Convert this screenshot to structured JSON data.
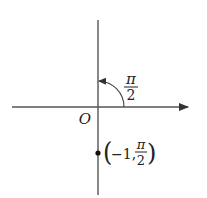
{
  "diagram": {
    "type": "polar-coordinate-plot",
    "colors": {
      "axis": "#555555",
      "text": "#222222",
      "point": "#111111",
      "background": "#ffffff"
    },
    "origin_label": "O",
    "angle_label": {
      "numerator": "π",
      "denominator": "2"
    },
    "point": {
      "label_open": "(",
      "label_r": "−1,",
      "label_theta_numerator": "π",
      "label_theta_denominator": "2",
      "label_close": ")"
    }
  }
}
